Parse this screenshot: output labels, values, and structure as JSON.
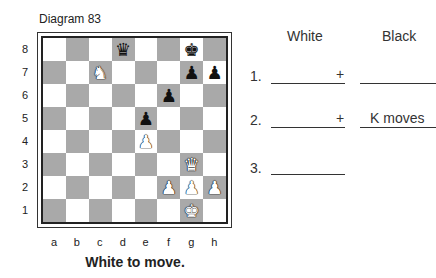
{
  "diagram": {
    "caption": "Diagram 83",
    "to_move": "White to move.",
    "ranks": [
      "8",
      "7",
      "6",
      "5",
      "4",
      "3",
      "2",
      "1"
    ],
    "files": [
      "a",
      "b",
      "c",
      "d",
      "e",
      "f",
      "g",
      "h"
    ],
    "pieces": {
      "d8": {
        "glyph": "♛",
        "color": "black",
        "name": "black-queen"
      },
      "g8": {
        "glyph": "♚",
        "color": "black",
        "name": "black-king"
      },
      "c7": {
        "glyph": "♞",
        "color": "white",
        "name": "white-knight"
      },
      "g7": {
        "glyph": "♟",
        "color": "black",
        "name": "black-pawn"
      },
      "h7": {
        "glyph": "♟",
        "color": "black",
        "name": "black-pawn"
      },
      "f6": {
        "glyph": "♟",
        "color": "black",
        "name": "black-pawn"
      },
      "e5": {
        "glyph": "♟",
        "color": "black",
        "name": "black-pawn"
      },
      "e4": {
        "glyph": "♟",
        "color": "white",
        "name": "white-pawn"
      },
      "g3": {
        "glyph": "♛",
        "color": "white",
        "name": "white-queen"
      },
      "f2": {
        "glyph": "♟",
        "color": "white",
        "name": "white-pawn"
      },
      "g2": {
        "glyph": "♟",
        "color": "white",
        "name": "white-pawn"
      },
      "h2": {
        "glyph": "♟",
        "color": "white",
        "name": "white-pawn"
      },
      "g1": {
        "glyph": "♚",
        "color": "white",
        "name": "white-king"
      }
    },
    "colors": {
      "light_square": "#ffffff",
      "dark_square": "#a9a9a9"
    }
  },
  "answer_sheet": {
    "headers": {
      "white": "White",
      "black": "Black"
    },
    "rows": [
      {
        "number": "1.",
        "white_suffix": "+",
        "black_text": ""
      },
      {
        "number": "2.",
        "white_suffix": "+",
        "black_text": "K moves"
      },
      {
        "number": "3.",
        "white_suffix": "",
        "black_text": ""
      }
    ]
  }
}
